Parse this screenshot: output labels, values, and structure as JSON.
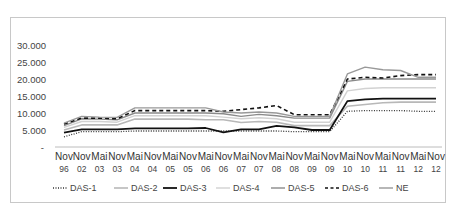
{
  "chart_data": {
    "type": "line",
    "title": "",
    "xlabel": "",
    "ylabel": "",
    "ylim": [
      0,
      30000
    ],
    "yticks": [
      "-",
      "5.000",
      "10.000",
      "15.000",
      "20.000",
      "25.000",
      "30.000"
    ],
    "grid": false,
    "legend_position": "bottom",
    "categories": [
      "Nov 96",
      "Nov 02",
      "Mai 03",
      "Nov 03",
      "Mai 04",
      "Nov 04",
      "Mai 05",
      "Nov 05",
      "Mai 06",
      "Nov 06",
      "Mai 07",
      "Nov 07",
      "Mai 08",
      "Nov 08",
      "Mai 09",
      "Nov 09",
      "Mai 10",
      "Nov 10",
      "Mai 11",
      "Nov 11",
      "Mai 12",
      "Nov 12"
    ],
    "category_top": [
      "Nov",
      "Nov",
      "Mai",
      "Nov",
      "Mai",
      "Nov",
      "Mai",
      "Nov",
      "Mai",
      "Nov",
      "Mai",
      "Nov",
      "Mai",
      "Nov",
      "Mai",
      "Nov",
      "Mai",
      "Nov",
      "Mai",
      "Nov",
      "Mai",
      "Nov"
    ],
    "category_bottom": [
      "96",
      "02",
      "03",
      "03",
      "04",
      "04",
      "05",
      "05",
      "06",
      "06",
      "07",
      "07",
      "08",
      "08",
      "09",
      "09",
      "10",
      "10",
      "11",
      "11",
      "12",
      "12"
    ],
    "series": [
      {
        "name": "DAS-1",
        "style": "dotted",
        "color": "#333333",
        "width": 1.3,
        "values": [
          3000,
          4500,
          4500,
          4500,
          4700,
          4700,
          4700,
          4700,
          4700,
          4700,
          4700,
          4700,
          4700,
          4500,
          4500,
          4500,
          10500,
          10700,
          10700,
          10700,
          10500,
          10500
        ]
      },
      {
        "name": "DAS-2",
        "style": "solid",
        "color": "#b8b8b8",
        "width": 1.6,
        "values": [
          5000,
          6500,
          6500,
          6500,
          8200,
          8200,
          8200,
          8200,
          8000,
          8000,
          7200,
          7500,
          7300,
          6300,
          6300,
          6300,
          12000,
          12500,
          13000,
          13200,
          13200,
          13200
        ]
      },
      {
        "name": "DAS-3",
        "style": "solid",
        "color": "#111111",
        "width": 1.8,
        "values": [
          4200,
          5200,
          5200,
          5200,
          5500,
          5500,
          5500,
          5500,
          5600,
          4300,
          5200,
          5200,
          6200,
          5800,
          5000,
          5000,
          13500,
          14000,
          14200,
          14200,
          14200,
          14200
        ]
      },
      {
        "name": "DAS-4",
        "style": "solid",
        "color": "#d2d2d2",
        "width": 1.4,
        "values": [
          5800,
          7500,
          7500,
          7300,
          9200,
          9200,
          9200,
          9200,
          9200,
          8800,
          8300,
          8600,
          8300,
          7300,
          7300,
          7300,
          16500,
          17200,
          17400,
          17400,
          17400,
          17400
        ]
      },
      {
        "name": "DAS-5",
        "style": "solid",
        "color": "#8a8a8a",
        "width": 1.4,
        "values": [
          6300,
          8300,
          8200,
          8000,
          10000,
          10000,
          10000,
          10000,
          10000,
          9800,
          9000,
          9600,
          9200,
          8500,
          8500,
          8500,
          19300,
          20000,
          20000,
          20000,
          20000,
          20000
        ]
      },
      {
        "name": "DAS-6",
        "style": "dashed",
        "color": "#111111",
        "width": 1.6,
        "values": [
          6800,
          8500,
          8500,
          8300,
          10700,
          10700,
          10700,
          10700,
          10700,
          10500,
          11000,
          11500,
          12200,
          9500,
          9500,
          9500,
          20000,
          20500,
          20300,
          21000,
          21300,
          21300
        ]
      },
      {
        "name": "NE",
        "style": "solid",
        "color": "#999999",
        "width": 1.4,
        "values": [
          7000,
          9000,
          8800,
          8700,
          11500,
          11500,
          11500,
          11500,
          11500,
          10300,
          10000,
          10300,
          10000,
          9000,
          9000,
          9000,
          21500,
          23500,
          22700,
          22500,
          20500,
          20500
        ]
      }
    ]
  },
  "legend": {
    "items": [
      {
        "label": "DAS-1"
      },
      {
        "label": "DAS-2"
      },
      {
        "label": "DAS-3"
      },
      {
        "label": "DAS-4"
      },
      {
        "label": "DAS-5"
      },
      {
        "label": "DAS-6"
      },
      {
        "label": "NE"
      }
    ]
  }
}
